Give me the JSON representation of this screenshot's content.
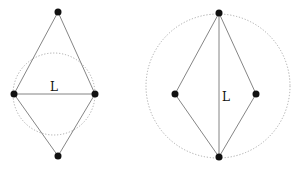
{
  "diagrams": [
    {
      "label": "L",
      "nodes": [
        [
          58,
          12
        ],
        [
          14,
          94
        ],
        [
          95,
          94
        ],
        [
          58,
          156
        ]
      ],
      "circle": {
        "cx": 54,
        "cy": 94,
        "r": 41
      },
      "chord": "horizontal"
    },
    {
      "label": "L",
      "nodes": [
        [
          219,
          13
        ],
        [
          175,
          94
        ],
        [
          256,
          94
        ],
        [
          219,
          157
        ]
      ],
      "circle": {
        "cx": 218,
        "cy": 86,
        "r": 72
      },
      "chord": "vertical"
    }
  ],
  "colors": {
    "edge": "#777777",
    "node": "#111111",
    "circle": "#aaaaaa"
  }
}
